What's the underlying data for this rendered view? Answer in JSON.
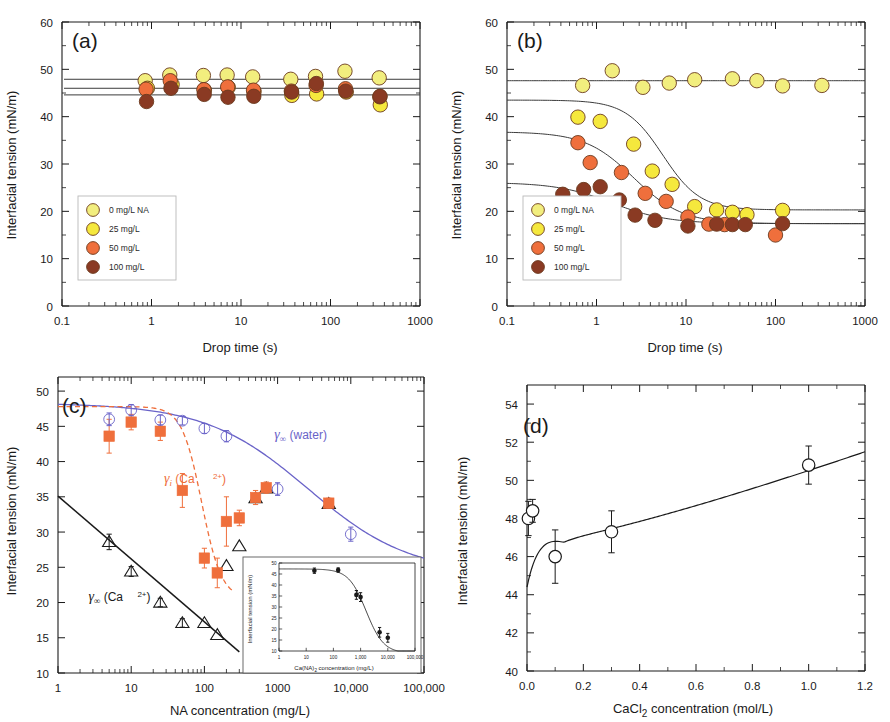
{
  "figure": {
    "panels": [
      "a",
      "b",
      "c",
      "d"
    ],
    "colors": {
      "s0": "#f2ee7e",
      "s25": "#f5e83d",
      "s50": "#ef6f3c",
      "s100": "#8a3a23",
      "water_curve": "#6a63c8",
      "ca_i_curve": "#ef6f3c",
      "ca_inf_curve": "#1a1a1a",
      "axis": "#1a1a1a"
    },
    "legend_labels": [
      "0 mg/L NA",
      "25 mg/L",
      "50 mg/L",
      "100 mg/L"
    ]
  },
  "chart_data": [
    {
      "panel": "a",
      "type": "scatter",
      "title": "(a)",
      "xlabel": "Drop time (s)",
      "ylabel": "Interfacial tension  (mN/m)",
      "xscale": "log",
      "xlim": [
        0.1,
        1000
      ],
      "ylim": [
        0,
        60
      ],
      "xticks": [
        0.1,
        1,
        10,
        100,
        1000
      ],
      "xticklabels": [
        "0.1",
        "1",
        "10",
        "100",
        "1000"
      ],
      "yticks": [
        0,
        10,
        20,
        30,
        40,
        50,
        60
      ],
      "yticklabels": [
        "0",
        "10",
        "20",
        "30",
        "40",
        "50",
        "60"
      ],
      "legend_position": "lower-left",
      "grid": false,
      "hlines": [
        47.9,
        46.0,
        44.6
      ],
      "series": [
        {
          "name": "0 mg/L NA",
          "color": "#f2ee7e",
          "x": [
            0.85,
            1.6,
            3.8,
            7.0,
            13.5,
            36,
            68,
            145,
            350
          ],
          "y": [
            47.6,
            48.8,
            48.7,
            48.8,
            48.4,
            47.9,
            48.5,
            49.6,
            48.2
          ]
        },
        {
          "name": "25 mg/L",
          "color": "#f5e83d",
          "x": [
            0.9,
            1.7,
            3.9,
            7.2,
            14.0,
            37,
            70,
            150,
            360
          ],
          "y": [
            46.0,
            46.8,
            45.6,
            46.2,
            45.3,
            44.5,
            44.8,
            45.2,
            42.5
          ]
        },
        {
          "name": "50 mg/L",
          "color": "#ef6f3c",
          "x": [
            0.87,
            1.62,
            3.85,
            7.1,
            13.8,
            36.5,
            69,
            147,
            355
          ],
          "y": [
            45.8,
            47.6,
            45.7,
            46.3,
            45.6,
            45.4,
            46.6,
            45.9,
            44.2
          ]
        },
        {
          "name": "100 mg/L",
          "color": "#8a3a23",
          "x": [
            0.88,
            1.65,
            3.88,
            7.15,
            13.9,
            36.8,
            69.5,
            148,
            358
          ],
          "y": [
            43.2,
            46.0,
            44.7,
            44.1,
            44.3,
            45.2,
            47.0,
            45.4,
            44.3
          ]
        }
      ]
    },
    {
      "panel": "b",
      "type": "scatter",
      "title": "(b)",
      "xlabel": "Drop time (s)",
      "ylabel": "Interfacial tension  (mN/m)",
      "xscale": "log",
      "xlim": [
        0.1,
        1000
      ],
      "ylim": [
        0,
        60
      ],
      "xticks": [
        0.1,
        1,
        10,
        100,
        1000
      ],
      "xticklabels": [
        "0.1",
        "1",
        "10",
        "100",
        "1000"
      ],
      "yticks": [
        0,
        10,
        20,
        30,
        40,
        50,
        60
      ],
      "yticklabels": [
        "0",
        "10",
        "20",
        "30",
        "40",
        "50",
        "60"
      ],
      "legend_position": "lower-left",
      "grid": false,
      "fits": [
        {
          "name": "0 mg/L NA",
          "gamma0": 47.6,
          "gammainf": 47.6,
          "t_half": 5,
          "slope": 1
        },
        {
          "name": "25 mg/L",
          "gamma0": 43.5,
          "gammainf": 20.3,
          "t_half": 5.5,
          "slope": 2.1
        },
        {
          "name": "50 mg/L",
          "gamma0": 36.8,
          "gammainf": 17.4,
          "t_half": 2.6,
          "slope": 1.6
        },
        {
          "name": "100 mg/L",
          "gamma0": 26.1,
          "gammainf": 17.4,
          "t_half": 1.5,
          "slope": 1.4
        }
      ],
      "series": [
        {
          "name": "0 mg/L NA",
          "color": "#f2ee7e",
          "x": [
            0.7,
            1.5,
            3.3,
            6.5,
            12.5,
            33,
            62,
            120,
            330
          ],
          "y": [
            46.6,
            49.7,
            46.2,
            47.1,
            47.8,
            48.0,
            47.6,
            46.5,
            46.6
          ]
        },
        {
          "name": "25 mg/L",
          "color": "#f5e83d",
          "x": [
            0.62,
            1.1,
            2.6,
            4.2,
            7.0,
            12.5,
            22,
            33,
            48,
            120
          ],
          "y": [
            39.9,
            39.0,
            34.2,
            28.5,
            25.7,
            21.0,
            20.3,
            19.8,
            19.3,
            20.2
          ]
        },
        {
          "name": "50 mg/L",
          "color": "#ef6f3c",
          "x": [
            0.62,
            0.85,
            1.9,
            3.5,
            6.0,
            10.5,
            18,
            27,
            100
          ],
          "y": [
            34.5,
            30.3,
            28.2,
            23.8,
            22.1,
            18.8,
            17.3,
            17.2,
            15.0
          ]
        },
        {
          "name": "100 mg/L",
          "color": "#8a3a23",
          "x": [
            0.42,
            0.72,
            1.1,
            1.8,
            2.7,
            4.5,
            10.5,
            22,
            33,
            46,
            120
          ],
          "y": [
            23.6,
            24.6,
            25.2,
            22.4,
            19.2,
            18.1,
            16.9,
            17.3,
            17.2,
            17.2,
            17.4
          ]
        }
      ]
    },
    {
      "panel": "c",
      "type": "scatter",
      "title": "(c)",
      "xlabel": "NA concentration (mg/L)",
      "ylabel": "Interfacial tension  (mN/m)",
      "xscale": "log",
      "xlim": [
        1,
        100000
      ],
      "ylim": [
        10,
        52
      ],
      "xticks": [
        1,
        10,
        100,
        1000,
        10000,
        100000
      ],
      "xticklabels": [
        "1",
        "10",
        "100",
        "1000",
        "10,000",
        "100,000"
      ],
      "yticks": [
        10,
        15,
        20,
        25,
        30,
        35,
        40,
        45,
        50
      ],
      "yticklabels": [
        "10",
        "15",
        "20",
        "25",
        "30",
        "35",
        "40",
        "45",
        "50"
      ],
      "grid": false,
      "annotations": [
        {
          "text": "γ∞ (water)",
          "color": "#6a63c8",
          "x": 900,
          "y": 43.2
        },
        {
          "text": "γi (Ca2+)",
          "color": "#ef6f3c",
          "x": 28,
          "y": 37.0
        },
        {
          "text": "γ∞ (Ca2+)",
          "color": "#1a1a1a",
          "x": 2.6,
          "y": 20.2
        }
      ],
      "series": [
        {
          "name": "gamma-inf-water",
          "marker": "open-circle",
          "color": "#6a63c8",
          "x": [
            5,
            10,
            25,
            50,
            100,
            200,
            1000,
            10000
          ],
          "y": [
            46.0,
            47.3,
            45.9,
            45.8,
            44.7,
            43.6,
            36.1,
            29.7
          ],
          "yerr": [
            0.9,
            0.8,
            0.7,
            0.6,
            0.7,
            0.8,
            0.9,
            1.0
          ]
        },
        {
          "name": "gamma-i-Ca",
          "marker": "filled-square",
          "color": "#ef6f3c",
          "x": [
            5,
            10,
            25,
            50,
            100,
            150,
            200,
            300,
            500,
            700,
            5000
          ],
          "y": [
            43.6,
            45.6,
            44.3,
            35.9,
            26.3,
            24.2,
            31.5,
            32.0,
            34.9,
            36.3,
            34.1
          ],
          "yerr": [
            2.4,
            1.1,
            1.3,
            2.4,
            1.4,
            2.1,
            3.5,
            1.1,
            1.0,
            0.8,
            0.7
          ]
        },
        {
          "name": "gamma-inf-Ca",
          "marker": "open-triangle",
          "color": "#1a1a1a",
          "x": [
            5,
            10,
            25,
            50,
            100,
            150,
            200,
            300,
            500,
            700,
            5000
          ],
          "y": [
            28.6,
            24.4,
            20.0,
            17.1,
            17.1,
            15.4,
            25.2,
            28.0,
            34.8,
            36.2,
            34.0
          ],
          "yerr": [
            1.1,
            0.7,
            0.6,
            0.6,
            0.0,
            0.0,
            0.0,
            0.0,
            0.0,
            0.0,
            0.0
          ]
        }
      ],
      "curves": [
        {
          "name": "water-fit",
          "color": "#6a63c8",
          "style": "solid"
        },
        {
          "name": "ca-i-fit",
          "color": "#ef6f3c",
          "style": "dashed"
        },
        {
          "name": "ca-inf-fit",
          "color": "#1a1a1a",
          "style": "solid"
        }
      ],
      "inset": {
        "type": "scatter",
        "xlabel": "Ca(NA)2 concentration (mg/L)",
        "ylabel": "Interfacial tension (mN/m)",
        "xscale": "log",
        "xlim": [
          1,
          100000
        ],
        "ylim": [
          10,
          50
        ],
        "xticks": [
          1,
          10,
          100,
          1000,
          10000,
          100000
        ],
        "xticklabels": [
          "1",
          "10",
          "100",
          "1,000",
          "10,000",
          "100,000"
        ],
        "yticks": [
          10,
          15,
          20,
          25,
          30,
          35,
          40,
          45,
          50
        ],
        "yticklabels": [
          "10",
          "15",
          "20",
          "25",
          "30",
          "35",
          "40",
          "45",
          "50"
        ],
        "x": [
          20,
          150,
          700,
          1000,
          5000,
          10000
        ],
        "y": [
          46.5,
          46.8,
          35.5,
          34.5,
          18.5,
          16.0
        ],
        "yerr": [
          1.2,
          1.0,
          2.0,
          2.0,
          2.2,
          2.0
        ]
      }
    },
    {
      "panel": "d",
      "type": "scatter",
      "title": "(d)",
      "xlabel": "CaCl2 concentration (mol/L)",
      "ylabel": "Interfacial tension (mN/m)",
      "xscale": "linear",
      "xlim": [
        0.0,
        1.2
      ],
      "ylim": [
        40,
        55
      ],
      "xticks": [
        0.0,
        0.2,
        0.4,
        0.6,
        0.8,
        1.0,
        1.2
      ],
      "xticklabels": [
        "0.0",
        "0.2",
        "0.4",
        "0.6",
        "0.8",
        "1.0",
        "1.2"
      ],
      "yticks": [
        40,
        42,
        44,
        46,
        48,
        50,
        52,
        54
      ],
      "yticklabels": [
        "40",
        "42",
        "44",
        "46",
        "48",
        "50",
        "52",
        "54"
      ],
      "grid": false,
      "marker": "open-circle",
      "curve_color": "#1a1a1a",
      "x": [
        0.005,
        0.02,
        0.1,
        0.3,
        1.0
      ],
      "y": [
        48.0,
        48.4,
        46.0,
        47.3,
        50.8
      ],
      "yerr": [
        0.9,
        0.6,
        1.4,
        1.1,
        1.0
      ]
    }
  ]
}
